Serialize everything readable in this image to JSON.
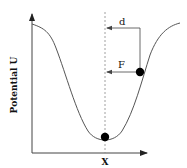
{
  "diagram": {
    "type": "potential-well",
    "axes": {
      "y_label": "Potential U",
      "x_label": "X"
    },
    "annotations": {
      "displacement_label": "d",
      "force_label": "F"
    },
    "particles": [
      {
        "name": "equilibrium-ball",
        "position": "well minimum"
      },
      {
        "name": "displaced-ball",
        "position": "right wall of well"
      }
    ],
    "colors": {
      "stroke": "#555555",
      "ball": "#000000",
      "dashed": "#888888"
    }
  }
}
